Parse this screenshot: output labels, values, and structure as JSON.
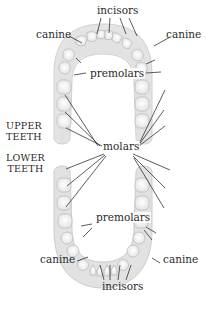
{
  "diagram": {
    "labels": {
      "upper_incisors": "incisors",
      "upper_canine_left": "canine",
      "upper_canine_right": "canine",
      "upper_premolars": "premolars",
      "molars": "molars",
      "lower_premolars": "premolars",
      "lower_canine_left": "canine",
      "lower_canine_right": "canine",
      "lower_incisors": "incisors"
    },
    "side_labels": {
      "upper_line1": "UPPER",
      "upper_line2": "TEETH",
      "lower_line1": "LOWER",
      "lower_line2": "TEETH"
    },
    "colors": {
      "arch_fill": "#e4e4e4",
      "arch_edge": "#c9c9c9",
      "tooth_fill": "#f4f4f4",
      "tooth_edge": "#bdbdbd",
      "leader_line": "#333333",
      "text": "#2a2a2a"
    }
  }
}
